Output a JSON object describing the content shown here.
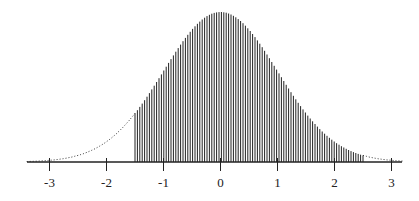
{
  "chart_data": {
    "type": "area",
    "title": "",
    "xlabel": "",
    "ylabel": "",
    "distribution": {
      "name": "normal",
      "mean": 0,
      "sd": 1
    },
    "shaded_region": {
      "from": -1.5,
      "to": 2.5,
      "style": "vertical-hatch"
    },
    "unshaded_style": "dotted",
    "xlim": [
      -3.4,
      3.2
    ],
    "x_ticks": [
      -3,
      -2,
      -1,
      0,
      1,
      2,
      3
    ],
    "x_tick_labels": [
      "-3",
      "-2",
      "-1",
      "0",
      "1",
      "2",
      "3"
    ],
    "grid": false,
    "legend": null
  },
  "colors": {
    "ink": "#222222",
    "background": "#ffffff"
  }
}
